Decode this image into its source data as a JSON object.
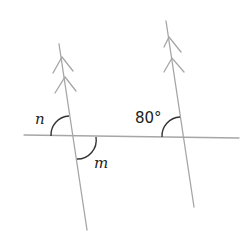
{
  "diagram": {
    "type": "parallel-lines-transversal",
    "labels": {
      "angle_n": "n",
      "angle_m": "m",
      "given_angle": "80°"
    },
    "colors": {
      "lines": "#a6a6a6",
      "arcs": "#333333",
      "text": "#222222"
    }
  }
}
